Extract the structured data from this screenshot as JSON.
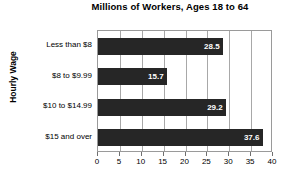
{
  "chart_data": {
    "type": "bar",
    "orientation": "horizontal",
    "title": "Millions of Workers, Ages 18 to 64",
    "xlabel": "",
    "ylabel": "Hourly Wage",
    "categories": [
      "Less than $8",
      "$8 to $9.99",
      "$10 to $14.99",
      "$15 and over"
    ],
    "values": [
      28.5,
      15.7,
      29.2,
      37.6
    ],
    "value_labels": [
      "28.5",
      "15.7",
      "29.2",
      "37.6"
    ],
    "xlim": [
      0,
      40
    ],
    "xticks": [
      0,
      5,
      10,
      15,
      20,
      25,
      30,
      35,
      40
    ],
    "xtick_labels": [
      "0",
      "5",
      "10",
      "15",
      "20",
      "25",
      "30",
      "35",
      "40"
    ],
    "grid": "vertical",
    "legend": null,
    "bar_color": "#262626",
    "value_label_color": "#ffffff",
    "gridline_color": "#a8a8a8",
    "plot_border_color": "#9a9a9a",
    "background_color": "#ffffff"
  }
}
